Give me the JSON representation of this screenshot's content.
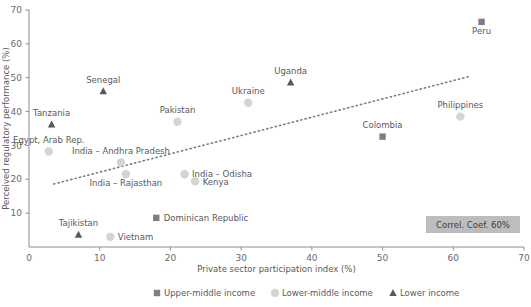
{
  "chart_data": {
    "type": "scatter",
    "title": "",
    "xlabel": "Private sector participation index (%)",
    "ylabel": "Perceived regulatory performance (%)",
    "xlim": [
      0,
      70
    ],
    "ylim": [
      0,
      70
    ],
    "xticks": [
      0,
      10,
      20,
      30,
      40,
      50,
      60,
      70
    ],
    "yticks": [
      0,
      10,
      20,
      30,
      40,
      50,
      60,
      70
    ],
    "xtick_labels": [
      "0",
      "10",
      "20",
      "30",
      "40",
      "50",
      "60",
      "70"
    ],
    "ytick_labels": [
      "0",
      "10",
      "20",
      "30",
      "40",
      "50",
      "60",
      "70"
    ],
    "grid": false,
    "legend_position": "bottom",
    "annotation": "Correl. Coef. 60%",
    "trendline": {
      "style": "dotted",
      "x0": 3.5,
      "y0": 18.6,
      "x1": 62.5,
      "y1": 50.5
    },
    "series": [
      {
        "name": "Upper-middle income",
        "marker": "square",
        "color": "#7e7e80",
        "points": [
          {
            "label": "Dominican Republic",
            "x": 18.0,
            "y": 8.6,
            "label_pos": "right"
          },
          {
            "label": "Colombia",
            "x": 50.0,
            "y": 32.6,
            "label_pos": "top"
          },
          {
            "label": "Peru",
            "x": 64.0,
            "y": 66.5,
            "label_pos": "bottom"
          }
        ]
      },
      {
        "name": "Lower-middle income",
        "marker": "circle",
        "color": "#d4d4d4",
        "points": [
          {
            "label": "Egypt, Arab Rep.",
            "x": 2.8,
            "y": 28.2,
            "label_pos": "top"
          },
          {
            "label": "Vietnam",
            "x": 11.5,
            "y": 3.0,
            "label_pos": "right"
          },
          {
            "label": "India – Andhra Pradesh",
            "x": 13.0,
            "y": 25.0,
            "label_pos": "top"
          },
          {
            "label": "India – Rajasthan",
            "x": 13.7,
            "y": 21.5,
            "label_pos": "bottom"
          },
          {
            "label": "Pakistan",
            "x": 21.0,
            "y": 37.0,
            "label_pos": "top"
          },
          {
            "label": "India – Odisha",
            "x": 22.0,
            "y": 21.5,
            "label_pos": "right"
          },
          {
            "label": "Kenya",
            "x": 23.5,
            "y": 19.4,
            "label_pos": "right"
          },
          {
            "label": "Ukraine",
            "x": 31.0,
            "y": 42.6,
            "label_pos": "top"
          },
          {
            "label": "Philippines",
            "x": 61.0,
            "y": 38.5,
            "label_pos": "top"
          }
        ]
      },
      {
        "name": "Lower income",
        "marker": "triangle",
        "color": "#58585a",
        "points": [
          {
            "label": "Tanzania",
            "x": 3.2,
            "y": 36.2,
            "label_pos": "top"
          },
          {
            "label": "Tajikistan",
            "x": 7.0,
            "y": 3.6,
            "label_pos": "top"
          },
          {
            "label": "Senegal",
            "x": 10.5,
            "y": 46.0,
            "label_pos": "top"
          },
          {
            "label": "Uganda",
            "x": 37.0,
            "y": 48.6,
            "label_pos": "top"
          }
        ]
      }
    ]
  },
  "legend": {
    "items": [
      {
        "label": "Upper-middle income",
        "marker": "square",
        "color": "#7e7e80"
      },
      {
        "label": "Lower-middle income",
        "marker": "circle",
        "color": "#d4d4d4"
      },
      {
        "label": "Lower income",
        "marker": "triangle",
        "color": "#58585a"
      }
    ]
  },
  "annotation_box": {
    "text": "Correl. Coef. 60%",
    "background": "#bdbdbd"
  }
}
